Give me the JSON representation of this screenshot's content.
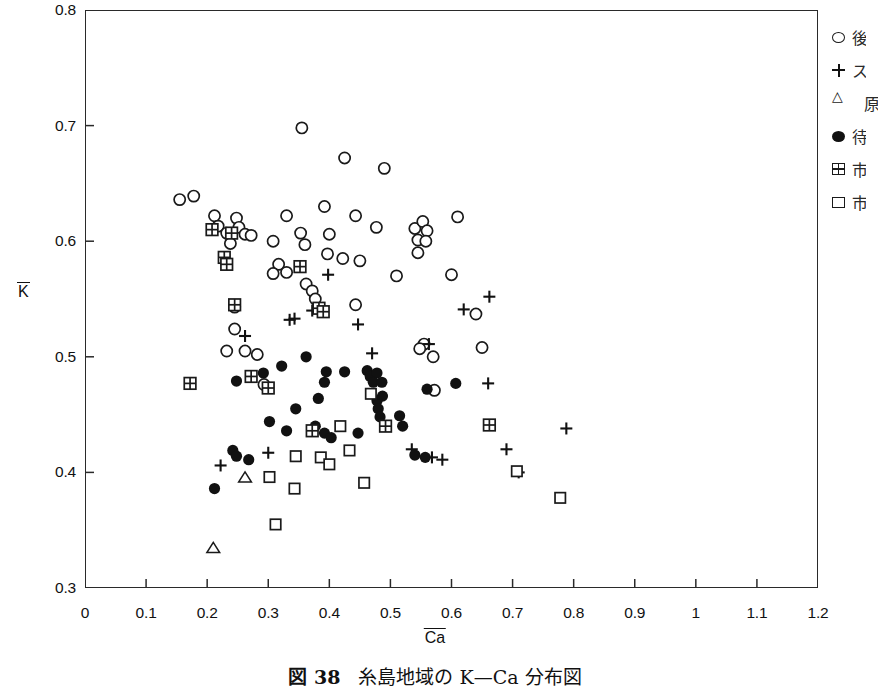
{
  "caption": {
    "figure_number": "図 38",
    "text": "糸島地域の K—Ca 分布図"
  },
  "legend": {
    "position": "right",
    "items": [
      {
        "marker": "open-circle",
        "label": "後"
      },
      {
        "marker": "plus",
        "label": "ス"
      },
      {
        "marker": "open-triangle",
        "label": "原"
      },
      {
        "marker": "filled-circle",
        "label": "待"
      },
      {
        "marker": "hatched-square",
        "label": "市"
      },
      {
        "marker": "open-square",
        "label": "市"
      }
    ]
  },
  "chart_data": {
    "type": "scatter",
    "title": "糸島地域の K—Ca 分布図",
    "xlabel": "Ca",
    "ylabel": "K",
    "xlabel_overbar": true,
    "ylabel_overbar": true,
    "xlim": [
      0,
      1.2
    ],
    "ylim": [
      0.3,
      0.8
    ],
    "xticks": [
      "0",
      "0.1",
      "0.2",
      "0.3",
      "0.4",
      "0.5",
      "0.6",
      "0.7",
      "0.8",
      "0.9",
      "1",
      "1.1",
      "1.2"
    ],
    "xtick_values": [
      0,
      0.1,
      0.2,
      0.3,
      0.4,
      0.5,
      0.6,
      0.7,
      0.8,
      0.9,
      1.0,
      1.1,
      1.2
    ],
    "yticks": [
      "0.3",
      "0.4",
      "0.5",
      "0.6",
      "0.7",
      "0.8"
    ],
    "ytick_values": [
      0.3,
      0.4,
      0.5,
      0.6,
      0.7,
      0.8
    ],
    "grid": false,
    "marker_color": "#111111",
    "frame_color": "#2a2a2a",
    "series": [
      {
        "name": "open-circle",
        "marker": "open-circle",
        "points": [
          [
            0.155,
            0.636
          ],
          [
            0.178,
            0.639
          ],
          [
            0.355,
            0.698
          ],
          [
            0.425,
            0.672
          ],
          [
            0.49,
            0.663
          ],
          [
            0.248,
            0.62
          ],
          [
            0.252,
            0.612
          ],
          [
            0.212,
            0.622
          ],
          [
            0.218,
            0.613
          ],
          [
            0.232,
            0.607
          ],
          [
            0.262,
            0.606
          ],
          [
            0.272,
            0.605
          ],
          [
            0.238,
            0.598
          ],
          [
            0.33,
            0.622
          ],
          [
            0.392,
            0.63
          ],
          [
            0.443,
            0.622
          ],
          [
            0.353,
            0.607
          ],
          [
            0.4,
            0.606
          ],
          [
            0.477,
            0.612
          ],
          [
            0.54,
            0.611
          ],
          [
            0.553,
            0.617
          ],
          [
            0.56,
            0.609
          ],
          [
            0.545,
            0.601
          ],
          [
            0.558,
            0.6
          ],
          [
            0.61,
            0.621
          ],
          [
            0.308,
            0.6
          ],
          [
            0.36,
            0.597
          ],
          [
            0.397,
            0.589
          ],
          [
            0.422,
            0.585
          ],
          [
            0.45,
            0.583
          ],
          [
            0.545,
            0.59
          ],
          [
            0.317,
            0.58
          ],
          [
            0.33,
            0.573
          ],
          [
            0.308,
            0.572
          ],
          [
            0.362,
            0.563
          ],
          [
            0.372,
            0.557
          ],
          [
            0.377,
            0.55
          ],
          [
            0.245,
            0.543
          ],
          [
            0.51,
            0.57
          ],
          [
            0.443,
            0.545
          ],
          [
            0.6,
            0.571
          ],
          [
            0.245,
            0.524
          ],
          [
            0.64,
            0.537
          ],
          [
            0.232,
            0.505
          ],
          [
            0.262,
            0.505
          ],
          [
            0.282,
            0.502
          ],
          [
            0.65,
            0.508
          ],
          [
            0.555,
            0.511
          ],
          [
            0.548,
            0.507
          ],
          [
            0.57,
            0.5
          ],
          [
            0.572,
            0.471
          ],
          [
            0.293,
            0.476
          ]
        ]
      },
      {
        "name": "plus",
        "marker": "plus",
        "points": [
          [
            0.262,
            0.518
          ],
          [
            0.335,
            0.532
          ],
          [
            0.343,
            0.533
          ],
          [
            0.372,
            0.54
          ],
          [
            0.385,
            0.54
          ],
          [
            0.398,
            0.571
          ],
          [
            0.447,
            0.528
          ],
          [
            0.47,
            0.503
          ],
          [
            0.563,
            0.511
          ],
          [
            0.62,
            0.541
          ],
          [
            0.662,
            0.552
          ],
          [
            0.66,
            0.477
          ],
          [
            0.69,
            0.42
          ],
          [
            0.71,
            0.4
          ],
          [
            0.788,
            0.438
          ],
          [
            0.568,
            0.413
          ],
          [
            0.585,
            0.411
          ],
          [
            0.535,
            0.42
          ],
          [
            0.222,
            0.406
          ],
          [
            0.3,
            0.417
          ]
        ]
      },
      {
        "name": "open-triangle",
        "marker": "open-triangle",
        "points": [
          [
            0.262,
            0.395
          ],
          [
            0.21,
            0.334
          ]
        ]
      },
      {
        "name": "filled-circle",
        "marker": "filled-circle",
        "points": [
          [
            0.248,
            0.479
          ],
          [
            0.292,
            0.486
          ],
          [
            0.322,
            0.492
          ],
          [
            0.362,
            0.5
          ],
          [
            0.395,
            0.487
          ],
          [
            0.425,
            0.487
          ],
          [
            0.462,
            0.488
          ],
          [
            0.467,
            0.483
          ],
          [
            0.478,
            0.486
          ],
          [
            0.472,
            0.478
          ],
          [
            0.486,
            0.478
          ],
          [
            0.487,
            0.466
          ],
          [
            0.607,
            0.477
          ],
          [
            0.56,
            0.472
          ],
          [
            0.392,
            0.478
          ],
          [
            0.302,
            0.444
          ],
          [
            0.345,
            0.455
          ],
          [
            0.382,
            0.464
          ],
          [
            0.478,
            0.462
          ],
          [
            0.48,
            0.455
          ],
          [
            0.483,
            0.448
          ],
          [
            0.377,
            0.44
          ],
          [
            0.33,
            0.436
          ],
          [
            0.392,
            0.434
          ],
          [
            0.403,
            0.43
          ],
          [
            0.447,
            0.434
          ],
          [
            0.515,
            0.449
          ],
          [
            0.52,
            0.44
          ],
          [
            0.242,
            0.419
          ],
          [
            0.248,
            0.414
          ],
          [
            0.268,
            0.411
          ],
          [
            0.54,
            0.415
          ],
          [
            0.557,
            0.413
          ],
          [
            0.212,
            0.386
          ]
        ]
      },
      {
        "name": "hatched-square",
        "marker": "hatched-square",
        "points": [
          [
            0.208,
            0.61
          ],
          [
            0.24,
            0.607
          ],
          [
            0.228,
            0.586
          ],
          [
            0.232,
            0.58
          ],
          [
            0.245,
            0.545
          ],
          [
            0.352,
            0.578
          ],
          [
            0.383,
            0.542
          ],
          [
            0.39,
            0.539
          ],
          [
            0.272,
            0.483
          ],
          [
            0.172,
            0.477
          ],
          [
            0.3,
            0.473
          ],
          [
            0.372,
            0.436
          ],
          [
            0.492,
            0.44
          ],
          [
            0.662,
            0.441
          ]
        ]
      },
      {
        "name": "open-square",
        "marker": "open-square",
        "points": [
          [
            0.468,
            0.468
          ],
          [
            0.418,
            0.44
          ],
          [
            0.433,
            0.419
          ],
          [
            0.386,
            0.413
          ],
          [
            0.4,
            0.407
          ],
          [
            0.345,
            0.414
          ],
          [
            0.302,
            0.396
          ],
          [
            0.343,
            0.386
          ],
          [
            0.457,
            0.391
          ],
          [
            0.312,
            0.355
          ],
          [
            0.707,
            0.401
          ],
          [
            0.778,
            0.378
          ]
        ]
      }
    ]
  }
}
